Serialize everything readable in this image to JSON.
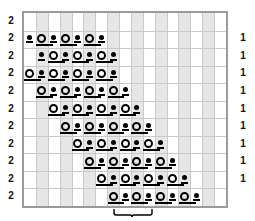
{
  "chart": {
    "type": "stitch-chart",
    "grid": {
      "columns": 17,
      "rows": 11
    },
    "colors": {
      "stripe": "#e6e6e6",
      "gridline": "#c9c9c9",
      "border": "#9a9a9a",
      "symbol": "#000000",
      "background": "#ffffff"
    },
    "row_labels_left": [
      "2",
      "2",
      "2",
      "2",
      "2",
      "2",
      "2",
      "2",
      "2",
      "2",
      "2"
    ],
    "row_labels_right": [
      "1",
      "1",
      "1",
      "1",
      "1",
      "1",
      "1",
      "1",
      "1"
    ],
    "legend_symbols": [
      {
        "name": "yarn-over",
        "glyph": "O"
      },
      {
        "name": "bobble",
        "glyph": "dot"
      },
      {
        "name": "decrease-bar",
        "glyph": "bar"
      }
    ],
    "repeat_bracket": {
      "label": "",
      "start_col": 7,
      "end_col": 10
    },
    "rows": [
      {
        "index": 0,
        "start": 0,
        "cells": []
      },
      {
        "index": 1,
        "start": 0,
        "cells": [
          "dot",
          "O",
          "dot",
          "O",
          "dot",
          "O",
          "dot"
        ]
      },
      {
        "index": 2,
        "start": 1,
        "cells": [
          "dot",
          "O",
          "dot",
          "O",
          "dot",
          "O",
          "dot"
        ]
      },
      {
        "index": 3,
        "start": 0,
        "cells": [
          "O",
          "dot",
          "O",
          "dot",
          "O",
          "dot",
          "O",
          "dot"
        ]
      },
      {
        "index": 4,
        "start": 1,
        "cells": [
          "O",
          "dot",
          "O",
          "dot",
          "O",
          "dot",
          "O",
          "dot"
        ]
      },
      {
        "index": 5,
        "start": 2,
        "cells": [
          "O",
          "dot",
          "O",
          "dot",
          "O",
          "dot",
          "O",
          "dot"
        ]
      },
      {
        "index": 6,
        "start": 3,
        "cells": [
          "O",
          "dot",
          "O",
          "dot",
          "O",
          "dot",
          "O",
          "dot"
        ]
      },
      {
        "index": 7,
        "start": 4,
        "cells": [
          "O",
          "dot",
          "O",
          "dot",
          "O",
          "dot",
          "O",
          "dot"
        ]
      },
      {
        "index": 8,
        "start": 5,
        "cells": [
          "O",
          "dot",
          "O",
          "dot",
          "O",
          "dot",
          "O",
          "dot"
        ]
      },
      {
        "index": 9,
        "start": 6,
        "cells": [
          "O",
          "dot",
          "O",
          "dot",
          "O",
          "dot",
          "O",
          "dot"
        ]
      },
      {
        "index": 10,
        "start": 7,
        "cells": [
          "O",
          "dot",
          "O",
          "dot",
          "O",
          "dot",
          "O",
          "dot"
        ]
      }
    ]
  }
}
